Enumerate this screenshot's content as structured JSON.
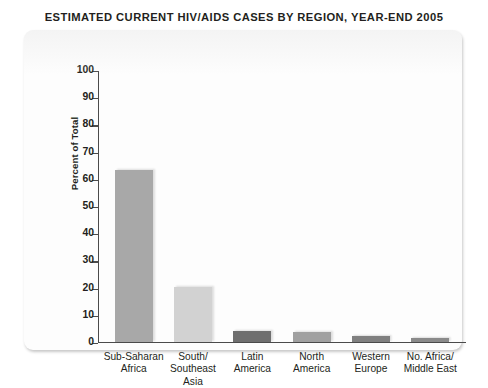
{
  "title": "ESTIMATED CURRENT HIV/AIDS CASES BY REGION, YEAR-END 2005",
  "axis": {
    "y_title": "Percent of Total",
    "ticks": [
      "0",
      "10",
      "20",
      "30",
      "40",
      "50",
      "60",
      "70",
      "80",
      "90",
      "100"
    ]
  },
  "chart_data": {
    "type": "bar",
    "title": "ESTIMATED CURRENT HIV/AIDS CASES BY REGION, YEAR-END 2005",
    "xlabel": "",
    "ylabel": "Percent of Total",
    "ylim": [
      0,
      100
    ],
    "ytick_step": 10,
    "grid": false,
    "legend": "none",
    "categories": [
      "Sub-Saharan Africa",
      "South/ Southeast Asia",
      "Latin America",
      "North America",
      "Western Europe",
      "No. Africa/ Middle East"
    ],
    "category_lines": [
      [
        "Sub-Saharan",
        "Africa"
      ],
      [
        "South/",
        "Southeast",
        "Asia"
      ],
      [
        "Latin",
        "America"
      ],
      [
        "North",
        "America"
      ],
      [
        "Western",
        "Europe"
      ],
      [
        "No. Africa/",
        "Middle East"
      ]
    ],
    "values": [
      63,
      20,
      4,
      3.5,
      2,
      1.5
    ],
    "bar_colors": [
      "#a8a8a8",
      "#d2d2d2",
      "#6f6f6f",
      "#a0a0a0",
      "#808080",
      "#8a8a8a"
    ]
  },
  "colors": {
    "title_text": "#231f20",
    "axis": "#4b4b4b",
    "card_background": "#fdfdfd",
    "page_background": "#ffffff"
  }
}
